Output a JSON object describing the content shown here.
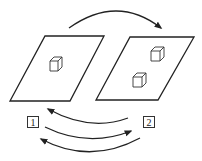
{
  "diagram": {
    "stroke_color": "#222222",
    "planes": [
      {
        "name": "left-plane",
        "cubes": 1
      },
      {
        "name": "right-plane",
        "cubes": 2
      }
    ],
    "labels": {
      "state_1": "1",
      "state_2": "2"
    },
    "arrows": [
      {
        "name": "top-arrow",
        "direction": "left-to-right"
      },
      {
        "name": "upper-return-arrow",
        "direction": "2-to-1"
      },
      {
        "name": "middle-arrow",
        "direction": "1-to-2"
      },
      {
        "name": "lower-return-arrow",
        "direction": "2-to-1"
      }
    ]
  }
}
